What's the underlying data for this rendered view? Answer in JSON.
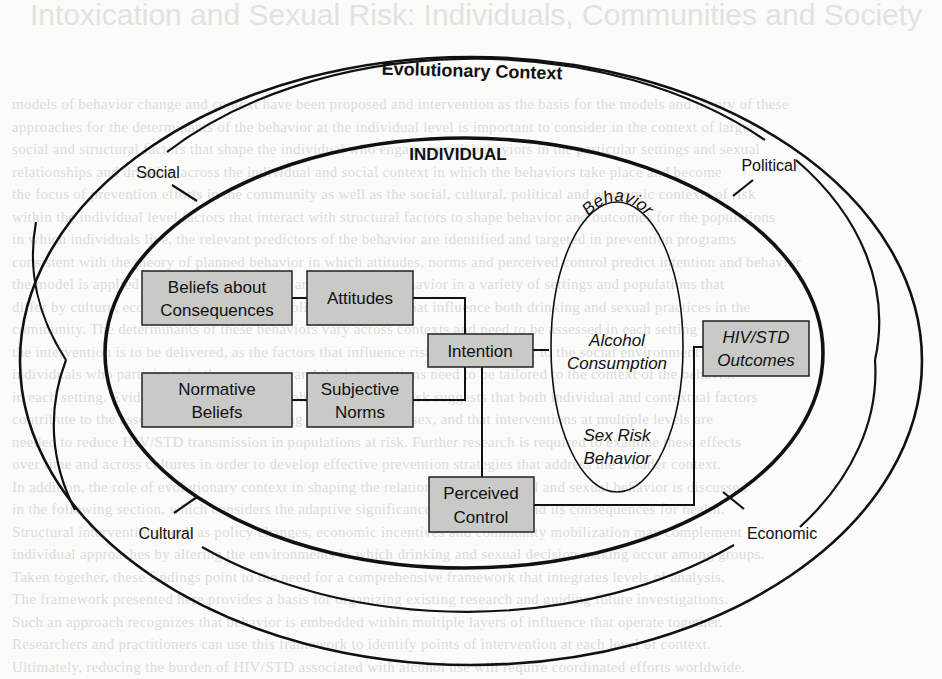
{
  "diagram": {
    "title": "Evolutionary Context",
    "inner_label": "INDIVIDUAL",
    "context_labels": {
      "top_left": "Social",
      "top_right": "Political",
      "bottom_left": "Cultural",
      "bottom_right": "Economic"
    },
    "boxes": {
      "beliefs_consequences": {
        "line1": "Beliefs about",
        "line2": "Consequences"
      },
      "attitudes": {
        "line1": "Attitudes"
      },
      "normative_beliefs": {
        "line1": "Normative",
        "line2": "Beliefs"
      },
      "subjective_norms": {
        "line1": "Subjective",
        "line2": "Norms"
      },
      "intention": {
        "line1": "Intention"
      },
      "perceived_control": {
        "line1": "Perceived",
        "line2": "Control"
      },
      "outcomes": {
        "line1": "HIV/STD",
        "line2": "Outcomes"
      }
    },
    "behavior": {
      "label": "Behavior",
      "item1_line1": "Alcohol",
      "item1_line2": "Consumption",
      "item2_line1": "Sex Risk",
      "item2_line2": "Behavior"
    },
    "colors": {
      "box_fill": "#c9c9c7",
      "line": "#111111",
      "page": "#fbfbfa"
    }
  }
}
